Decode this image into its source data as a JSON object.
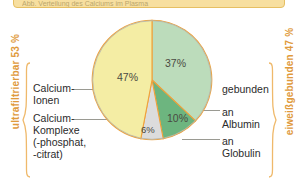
{
  "banner": {
    "text": "Abb. Verteilung des Calciums im Plasma"
  },
  "chart_data": {
    "type": "pie",
    "title": "Verteilung des Calciums im Plasma",
    "categories": [
      "Calcium-Ionen",
      "gebunden an Albumin",
      "gebunden an Globulin",
      "Calcium-Komplexe (-phosphat, -citrat)"
    ],
    "values": [
      47,
      37,
      10,
      6
    ],
    "labels": [
      "47%",
      "37%",
      "10%",
      "6%"
    ],
    "colors": [
      "#F4EDA4",
      "#BCDCBB",
      "#6DB57F",
      "#DCDCDC"
    ],
    "divider_color": "#EFA23C",
    "legend_position": "left-and-right",
    "grid": false
  },
  "pie": {
    "slices": [
      {
        "label": "37%",
        "value": 37,
        "color": "#BCDCBB"
      },
      {
        "label": "10%",
        "value": 10,
        "color": "#6DB57F"
      },
      {
        "label": "6%",
        "value": 6,
        "color": "#DCDCDC"
      },
      {
        "label": "47%",
        "value": 47,
        "color": "#F4EDA4"
      }
    ]
  },
  "left": {
    "axis_label": "ultrafiltrierbar 53 %",
    "items": [
      {
        "label": "Calcium-\nIonen"
      },
      {
        "label": "Calcium-\nKomplexe\n(-phosphat,\n-citrat)"
      }
    ]
  },
  "right": {
    "axis_label": "eiweißgebunden 47 %",
    "items": [
      {
        "label": "gebunden"
      },
      {
        "label": "an\nAlbumin"
      },
      {
        "label": "an\nGlobulin"
      }
    ]
  },
  "colors": {
    "accent_orange": "#E09A3C",
    "banner_bg": "#F7DFA0",
    "banner_border": "#E6BF63",
    "leader_line": "#9A9A92",
    "text": "#2B2B2B"
  }
}
